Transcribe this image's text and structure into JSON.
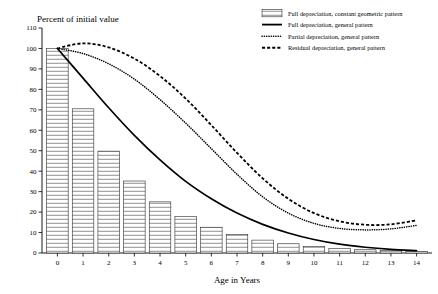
{
  "chart_data": {
    "type": "bar",
    "title": "",
    "xlabel": "Age in Years",
    "ylabel": "Percent of initial value",
    "xlim": [
      -0.6,
      14.6
    ],
    "ylim": [
      0,
      110
    ],
    "grid": false,
    "legend_position": "top-right",
    "x_ticks": [
      "0",
      "1",
      "2",
      "3",
      "4",
      "5",
      "6",
      "7",
      "8",
      "9",
      "10",
      "11",
      "12",
      "13",
      "14"
    ],
    "y_ticks": [
      "0",
      "10",
      "20",
      "30",
      "40",
      "50",
      "60",
      "70",
      "80",
      "90",
      "100",
      "110"
    ],
    "categories": [
      0,
      1,
      2,
      3,
      4,
      5,
      6,
      7,
      8,
      9,
      10,
      11,
      12,
      13,
      14
    ],
    "series": [
      {
        "name": "Full depreciation, constant geometric pattern",
        "style": "bar",
        "values": [
          100,
          70.5,
          49.8,
          35.2,
          25.0,
          17.8,
          12.6,
          9.0,
          6.3,
          4.5,
          3.2,
          2.3,
          1.6,
          1.2,
          0.8
        ]
      },
      {
        "name": "Full depreciation, general pattern",
        "style": "solid-line",
        "values": [
          100,
          85.5,
          71.0,
          57.5,
          45.5,
          35.0,
          26.5,
          19.5,
          14.0,
          9.8,
          6.6,
          4.3,
          2.8,
          1.8,
          1.2
        ]
      },
      {
        "name": "Partial depreciation, general pattern",
        "style": "dotted-line",
        "values": [
          100,
          97.5,
          92.5,
          85.0,
          75.0,
          63.5,
          51.0,
          38.5,
          27.5,
          19.5,
          14.5,
          12.0,
          11.3,
          11.8,
          13.5
        ]
      },
      {
        "name": "Residual depreciation, general pattern",
        "style": "dashed-line",
        "values": [
          100,
          102.5,
          100.5,
          95.0,
          86.5,
          75.5,
          62.5,
          49.0,
          36.5,
          26.5,
          19.5,
          15.5,
          13.8,
          14.0,
          16.0
        ]
      }
    ]
  },
  "axes": {
    "y_axis_title": "Percent of initial value",
    "x_axis_title": "Age in Years",
    "y_tick_labels": [
      "110",
      "100",
      "90",
      "80",
      "70",
      "60",
      "50",
      "40",
      "30",
      "20",
      "10",
      "0"
    ],
    "x_tick_labels": [
      "0",
      "1",
      "2",
      "3",
      "4",
      "5",
      "6",
      "7",
      "8",
      "9",
      "10",
      "11",
      "12",
      "13",
      "14"
    ]
  },
  "legend": {
    "items": [
      {
        "label": "Full depreciation, constant geometric pattern",
        "marker": "hatched-box-swatch"
      },
      {
        "label": "Full depreciation, general pattern",
        "marker": "solid-line-swatch"
      },
      {
        "label": "Partial depreciation, general pattern",
        "marker": "dotted-line-swatch"
      },
      {
        "label": "Residual depreciation, general pattern",
        "marker": "dashed-line-swatch"
      }
    ]
  },
  "colors": {
    "ink": "#000000",
    "background": "#ffffff",
    "bar_edge": "#2b2b2b",
    "bar_hatch": "#9a9a9a"
  }
}
